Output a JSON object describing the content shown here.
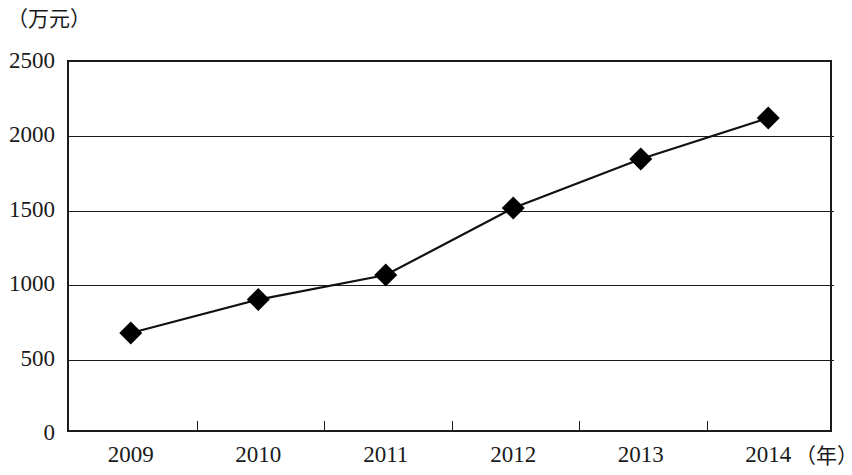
{
  "chart_data": {
    "type": "line",
    "title": "",
    "subtitle": "",
    "xlabel": "（年）",
    "ylabel": "（万元）",
    "categories": [
      "2009",
      "2010",
      "2011",
      "2012",
      "2013",
      "2014"
    ],
    "values": [
      665,
      890,
      1055,
      1505,
      1835,
      2110
    ],
    "series": [
      {
        "name": "",
        "values": [
          665,
          890,
          1055,
          1505,
          1835,
          2110
        ]
      }
    ],
    "ylim": [
      0,
      2500
    ],
    "y_ticks": [
      "0",
      "500",
      "1000",
      "1500",
      "2000",
      "2500"
    ],
    "y_tick_values": [
      0,
      500,
      1000,
      1500,
      2000,
      2500
    ],
    "x_ticks": [
      "2009",
      "2010",
      "2011",
      "2012",
      "2013",
      "2014"
    ],
    "grid": true,
    "grid_axis": "y",
    "legend": false,
    "legend_position": "none",
    "marker": "diamond",
    "line_color": "#111111",
    "marker_color": "#000000",
    "axis_color": "#1a1a1a",
    "background_color": "#ffffff"
  },
  "axes": {
    "y_unit_caption": "（万元）",
    "x_unit_caption": "（年）"
  }
}
